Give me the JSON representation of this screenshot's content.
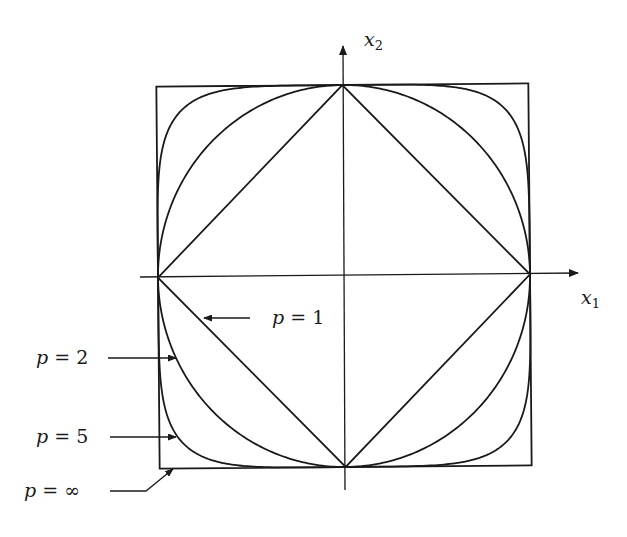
{
  "diagram": {
    "axes": {
      "x": {
        "var": "x",
        "sub": "1"
      },
      "y": {
        "var": "x",
        "sub": "2"
      }
    },
    "curves": [
      {
        "label_var": "p",
        "label_eq": " = ",
        "label_val": "1",
        "p": 1
      },
      {
        "label_var": "p",
        "label_eq": " = ",
        "label_val": "2",
        "p": 2
      },
      {
        "label_var": "p",
        "label_eq": " = ",
        "label_val": "5",
        "p": 5
      },
      {
        "label_var": "p",
        "label_eq": " = ",
        "label_val": "∞",
        "p": "infinity"
      }
    ],
    "stroke_color": "#1a1a1a",
    "background": "#ffffff"
  }
}
